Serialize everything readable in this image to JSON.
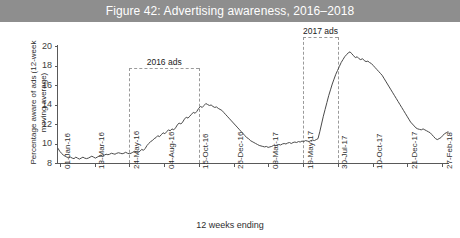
{
  "figure": {
    "title": "Figure 42: Advertising awareness, 2016–2018",
    "title_band_color": "#8e8e8e",
    "title_text_color": "#ffffff"
  },
  "axes": {
    "y_title": "Percentage aware of ads (12-week moving average)",
    "x_title": "12 weeks ending"
  },
  "annotations": {
    "ads_2016": "2016 ads",
    "ads_2017": "2017 ads"
  },
  "chart_data": {
    "type": "line",
    "title": "Figure 42: Advertising awareness, 2016–2018",
    "xlabel": "12 weeks ending",
    "ylabel": "Percentage aware of ads (12-week moving average)",
    "ylim": [
      8,
      20
    ],
    "yticks": [
      8,
      10,
      12,
      14,
      16,
      18,
      20
    ],
    "grid": false,
    "legend": "none",
    "line_color": "#4a4a4a",
    "xticklabels": [
      "01-Jan-16",
      "13-Mar-16",
      "24-May-16",
      "04-Aug-16",
      "15-Oct-16",
      "26-Dec-16",
      "08-Mar-17",
      "19-May-17",
      "30-Jul-17",
      "10-Oct-17",
      "21-Dec-17",
      "27-Feb-18"
    ],
    "annotations": [
      {
        "label": "2016 ads",
        "x_start": "24-May-16",
        "x_end": "15-Oct-16"
      },
      {
        "label": "2017 ads",
        "x_start": "19-May-17",
        "x_end": "30-Jul-17"
      }
    ],
    "series": [
      {
        "name": "Percentage aware of ads",
        "values": [
          9.5,
          9.2,
          9.0,
          8.8,
          8.7,
          8.6,
          8.55,
          8.6,
          8.5,
          8.45,
          8.6,
          8.5,
          8.4,
          8.5,
          8.6,
          8.5,
          8.45,
          8.5,
          8.6,
          8.7,
          8.6,
          8.5,
          8.6,
          8.7,
          8.8,
          8.7,
          8.8,
          8.9,
          8.85,
          8.9,
          9.0,
          8.95,
          8.9,
          9.0,
          9.05,
          9.0,
          8.95,
          9.0,
          9.1,
          9.0,
          8.95,
          9.0,
          9.1,
          9.2,
          9.15,
          9.1,
          9.2,
          9.4,
          9.3,
          9.5,
          9.8,
          10.0,
          10.2,
          10.3,
          10.5,
          10.6,
          10.8,
          10.7,
          10.9,
          11.1,
          11.0,
          11.2,
          11.4,
          11.3,
          11.5,
          11.4,
          11.6,
          11.9,
          12.1,
          12.0,
          12.2,
          12.5,
          12.7,
          12.6,
          12.8,
          13.0,
          13.2,
          13.1,
          13.3,
          13.6,
          13.8,
          13.7,
          13.9,
          14.1,
          14.0,
          13.9,
          13.95,
          13.8,
          13.7,
          13.75,
          13.6,
          13.5,
          13.4,
          13.2,
          13.0,
          12.8,
          12.6,
          12.4,
          12.2,
          12.0,
          11.8,
          11.6,
          11.4,
          11.2,
          11.0,
          10.8,
          10.6,
          10.5,
          10.3,
          10.2,
          10.1,
          10.0,
          9.9,
          9.8,
          9.75,
          9.7,
          9.65,
          9.7,
          9.6,
          9.65,
          9.7,
          9.8,
          9.75,
          9.85,
          9.9,
          9.85,
          9.95,
          10.0,
          9.95,
          10.05,
          10.1,
          10.0,
          10.1,
          10.15,
          10.1,
          10.2,
          10.15,
          10.25,
          10.2,
          10.3,
          10.25,
          10.2,
          10.3,
          10.35,
          10.3,
          10.4,
          10.5,
          11.2,
          12.0,
          12.8,
          13.5,
          14.2,
          14.9,
          15.5,
          16.1,
          16.6,
          17.1,
          17.5,
          17.9,
          18.3,
          18.6,
          18.9,
          19.1,
          19.3,
          19.4,
          19.2,
          19.0,
          18.8,
          18.9,
          18.7,
          18.6,
          18.7,
          18.5,
          18.4,
          18.45,
          18.3,
          18.2,
          18.0,
          17.8,
          17.6,
          17.4,
          17.2,
          17.0,
          16.7,
          16.4,
          16.1,
          15.8,
          15.5,
          15.2,
          14.9,
          14.6,
          14.3,
          14.0,
          13.7,
          13.4,
          13.1,
          12.8,
          12.5,
          12.2,
          12.0,
          11.8,
          11.6,
          11.5,
          11.45,
          11.4,
          11.5,
          11.4,
          11.3,
          11.2,
          11.1,
          10.9,
          10.7,
          10.5,
          10.4,
          10.5,
          10.6,
          10.8,
          11.0,
          11.1,
          11.2
        ]
      }
    ]
  }
}
